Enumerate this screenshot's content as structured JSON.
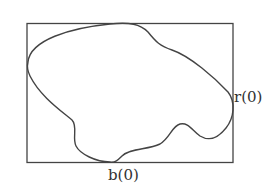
{
  "diagram": {
    "labels": {
      "right_point": "r(0)",
      "bottom_point": "b(0)"
    },
    "colors": {
      "stroke": "#444444",
      "background": "#ffffff"
    }
  }
}
